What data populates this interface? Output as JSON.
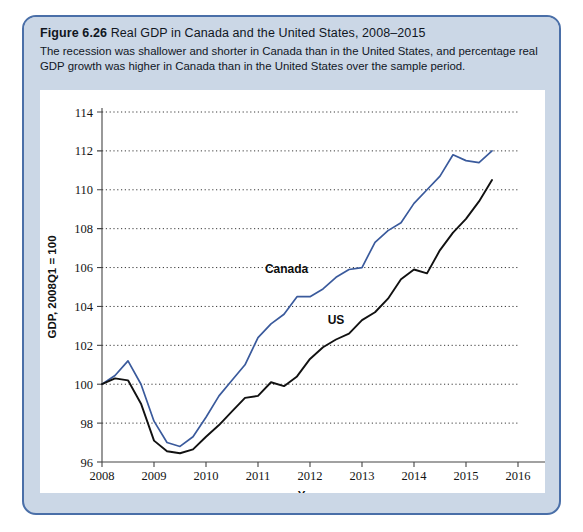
{
  "figure": {
    "number": "Figure 6.26",
    "title": "Real GDP in Canada and the United States, 2008–2015",
    "caption": "The recession was shallower and shorter in Canada than in the United States, and percentage real GDP growth was higher in Canada than in the United States over the sample period."
  },
  "colors": {
    "card_border": "#4a6fa8",
    "card_background": "#cbd7e6",
    "panel_background": "#ffffff",
    "canada_line": "#3a5a9c",
    "us_line": "#111111",
    "grid": "#3b3b3b"
  },
  "chart_data": {
    "type": "line",
    "title": "Real GDP in Canada and the United States, 2008–2015",
    "xlabel": "Year",
    "ylabel": "GDP, 2008Q1 = 100",
    "xlim": [
      2008,
      2016
    ],
    "ylim": [
      96,
      114
    ],
    "xticks": [
      2008,
      2009,
      2010,
      2011,
      2012,
      2013,
      2014,
      2015,
      2016
    ],
    "xtick_labels": [
      "2008",
      "2009",
      "2010",
      "2011",
      "2012",
      "2013",
      "2014",
      "2015",
      "2016"
    ],
    "yticks": [
      96,
      98,
      100,
      102,
      104,
      106,
      108,
      110,
      112,
      114
    ],
    "ytick_labels": [
      "96",
      "98",
      "100",
      "102",
      "104",
      "106",
      "108",
      "110",
      "112",
      "114"
    ],
    "grid": "horizontal-dotted",
    "legend": "in-plot-annotations",
    "x": [
      2008.0,
      2008.25,
      2008.5,
      2008.75,
      2009.0,
      2009.25,
      2009.5,
      2009.75,
      2010.0,
      2010.25,
      2010.5,
      2010.75,
      2011.0,
      2011.25,
      2011.5,
      2011.75,
      2012.0,
      2012.25,
      2012.5,
      2012.75,
      2013.0,
      2013.25,
      2013.5,
      2013.75,
      2014.0,
      2014.25,
      2014.5,
      2014.75,
      2015.0,
      2015.25,
      2015.5
    ],
    "series": [
      {
        "name": "Canada",
        "color": "#3a5a9c",
        "label_x": 2011.55,
        "label_y": 105.7,
        "values": [
          100.0,
          100.45,
          101.2,
          100.0,
          98.1,
          97.0,
          96.8,
          97.3,
          98.3,
          99.4,
          100.2,
          101.0,
          102.4,
          103.1,
          103.6,
          104.5,
          104.5,
          104.9,
          105.5,
          105.9,
          106.0,
          107.3,
          107.9,
          108.3,
          109.3,
          110.0,
          110.7,
          111.8,
          111.5,
          111.4,
          112.0
        ]
      },
      {
        "name": "US",
        "color": "#111111",
        "label_x": 2012.5,
        "label_y": 103.1,
        "values": [
          100.0,
          100.3,
          100.2,
          99.0,
          97.1,
          96.55,
          96.45,
          96.65,
          97.3,
          97.9,
          98.6,
          99.3,
          99.4,
          100.1,
          99.9,
          100.4,
          101.3,
          101.9,
          102.3,
          102.6,
          103.3,
          103.7,
          104.4,
          105.4,
          105.9,
          105.7,
          106.9,
          107.8,
          108.5,
          109.4,
          110.5
        ]
      }
    ]
  }
}
